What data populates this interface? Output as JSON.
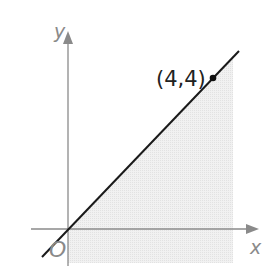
{
  "diagram": {
    "type": "coordinate-plane",
    "axes": {
      "x_label": "x",
      "y_label": "y",
      "origin_label": "O",
      "axis_color": "#8a8a8a"
    },
    "line": {
      "equation": "y = x",
      "color": "#1a1a1a"
    },
    "point": {
      "label": "(4,4)",
      "x": 4,
      "y": 4,
      "color": "#111111"
    },
    "shaded_region": {
      "description": "region under y = x from x = 0 to x = 4",
      "fill": "#ececec"
    }
  }
}
